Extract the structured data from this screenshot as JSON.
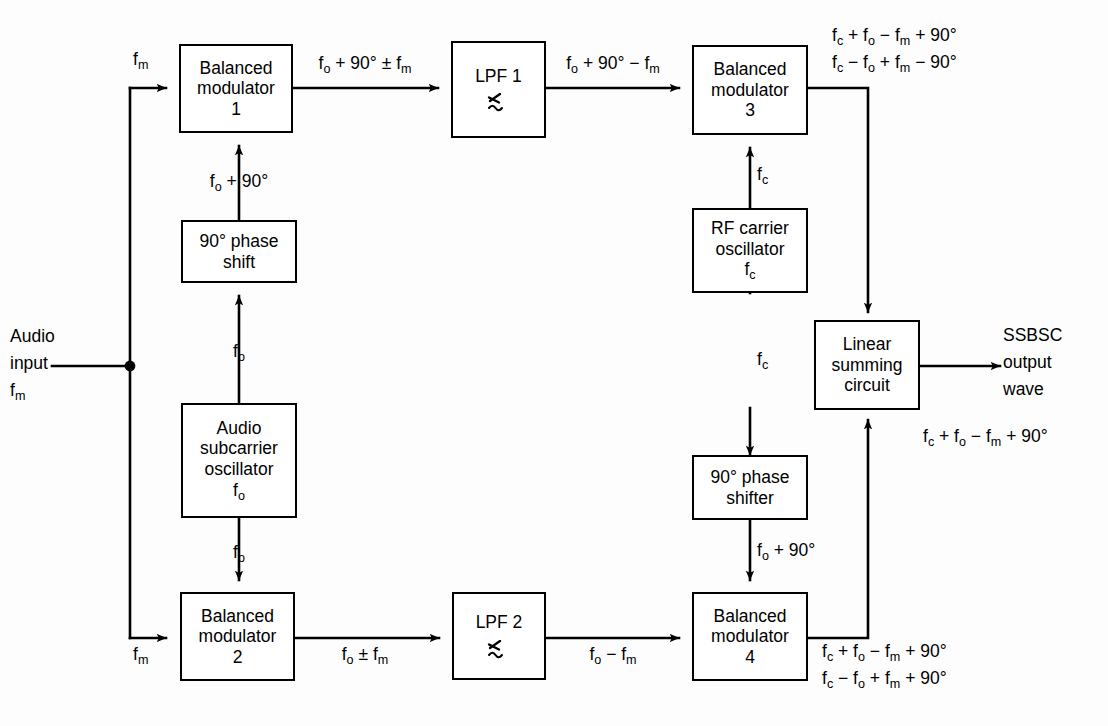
{
  "diagram": {
    "blocks": {
      "bm1": {
        "l1": "Balanced",
        "l2": "modulator",
        "l3": "1"
      },
      "lpf1": {
        "l1": "LPF 1"
      },
      "bm3": {
        "l1": "Balanced",
        "l2": "modulator",
        "l3": "3"
      },
      "ps_left": {
        "l1": "90° phase",
        "l2": "shift"
      },
      "aso": {
        "l1": "Audio",
        "l2": "subcarrier",
        "l3": "oscillator",
        "l4": "fₒ"
      },
      "rfo": {
        "l1": "RF carrier",
        "l2": "oscillator",
        "l3": "f_c"
      },
      "lsc": {
        "l1": "Linear",
        "l2": "summing",
        "l3": "circuit"
      },
      "ps_right": {
        "l1": "90° phase",
        "l2": "shifter"
      },
      "bm2": {
        "l1": "Balanced",
        "l2": "modulator",
        "l3": "2"
      },
      "lpf2": {
        "l1": "LPF 2"
      },
      "bm4": {
        "l1": "Balanced",
        "l2": "modulator",
        "l3": "4"
      }
    },
    "labels": {
      "audio_input_1": "Audio",
      "audio_input_2": "input",
      "audio_input_3": "f_m",
      "fm_top": "f_m",
      "fm_bottom": "f_m",
      "bm1_out": "f_o + 90° ± f_m",
      "lpf1_out": "f_o + 90° − f_m",
      "fo_plus_90_left": "f_o + 90°",
      "fo_to_phaseshift": "f_o",
      "fo_to_bm2": "f_o",
      "bm2_out": "f_o ± f_m",
      "lpf2_out": "f_o − f_m",
      "fc_to_bm3": "f_c",
      "fc_to_shifter": "f_c",
      "fo_plus_90_right": "f_o + 90°",
      "bm3_out_1": "f_c + f_o − f_m + 90°",
      "bm3_out_2": "f_c − f_o + f_m − 90°",
      "bm4_out_1": "f_c + f_o − f_m + 90°",
      "bm4_out_2": "f_c − f_o + f_m + 90°",
      "output_1": "SSBSC",
      "output_2": "output",
      "output_3": "wave",
      "output_expr": "f_c + f_o − f_m + 90°"
    },
    "icons": {
      "lpf_symbol": "lowpass-filter-response-icon",
      "junction": "junction-dot-icon"
    },
    "colors": {
      "line": "#000000",
      "background": "#ffffff"
    }
  }
}
